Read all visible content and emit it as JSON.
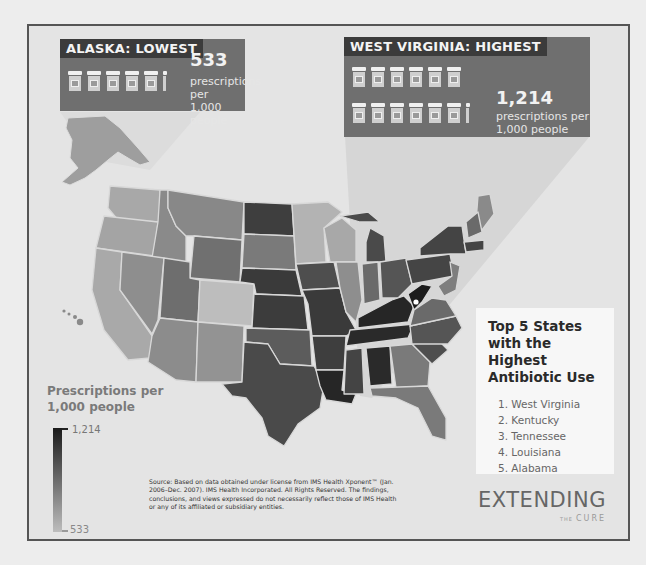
{
  "callouts": {
    "lowest": {
      "heading": "ALASKA: LOWEST",
      "value": "533",
      "unit_line1": "prescriptions per",
      "unit_line2": "1,000 people",
      "bottle_count_full": 5,
      "bottle_partial": true
    },
    "highest": {
      "heading": "WEST VIRGINIA: HIGHEST",
      "value": "1,214",
      "unit_line1": "prescriptions per",
      "unit_line2": "1,000 people",
      "bottle_count_full": 12,
      "bottle_partial": true
    }
  },
  "top5": {
    "title_line1": "Top 5 States",
    "title_line2": "with the Highest",
    "title_line3": "Antibiotic Use",
    "items": [
      "1. West Virginia",
      "2. Kentucky",
      "3. Tennessee",
      "4. Louisiana",
      "5. Alabama"
    ]
  },
  "legend": {
    "title_line1": "Prescriptions per",
    "title_line2": "1,000 people",
    "max_label": "1,214",
    "min_label": "533",
    "color_dark": "#1a1a1a",
    "color_light": "#bdbdbd"
  },
  "source": {
    "text": "Source: Based on data obtained under license from IMS Health Xponent™ (Jan. 2006–Dec. 2007). IMS Health Incorporated. All Rights Reserved. The findings, conclusions, and views expressed do not necessarily reflect those of IMS Health or any of its affiliated or subsidiary entities."
  },
  "logo": {
    "word": "EXTENDING",
    "the": "THE",
    "cure": "CURE"
  },
  "map": {
    "title": "Antibiotic prescriptions per 1,000 people by state",
    "shade_levels": {
      "darkest": [
        "West Virginia",
        "Kentucky",
        "Tennessee",
        "Louisiana",
        "Alabama"
      ],
      "dark": [
        "North Dakota",
        "Nebraska",
        "Kansas",
        "Missouri",
        "Arkansas",
        "Mississippi",
        "Texas",
        "Oklahoma",
        "Iowa",
        "Michigan",
        "Ohio",
        "Indiana",
        "Pennsylvania",
        "New York",
        "South Carolina",
        "North Carolina"
      ],
      "medium": [
        "Wyoming",
        "Utah",
        "South Dakota",
        "Illinois",
        "Georgia",
        "Virginia",
        "Idaho",
        "Montana",
        "Nevada",
        "Arizona",
        "New Mexico",
        "Florida",
        "Maine",
        "New Hampshire"
      ],
      "light": [
        "Washington",
        "Oregon",
        "California",
        "Colorado",
        "Minnesota",
        "Wisconsin",
        "Alaska",
        "Hawaii"
      ]
    }
  }
}
